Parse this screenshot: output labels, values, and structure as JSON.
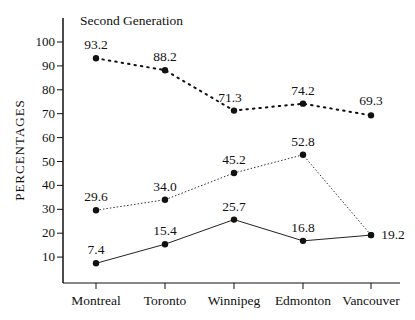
{
  "chart_data": {
    "type": "line",
    "title": "Second Generation",
    "xlabel": "",
    "ylabel": "PERCENTAGES",
    "categories": [
      "Montreal",
      "Toronto",
      "Winnipeg",
      "Edmonton",
      "Vancouver"
    ],
    "yticks": [
      10,
      20,
      30,
      40,
      50,
      60,
      70,
      80,
      90,
      100
    ],
    "ylim": [
      0,
      105
    ],
    "grid": false,
    "legend": "none",
    "series": [
      {
        "name": "upper (dotted)",
        "style": "dotted",
        "values": [
          93.2,
          88.2,
          71.3,
          74.2,
          69.3
        ],
        "labels": [
          "93.2",
          "88.2",
          "71.3",
          "74.2",
          "69.3"
        ]
      },
      {
        "name": "middle (fine dotted)",
        "style": "fine-dotted",
        "values": [
          29.6,
          34.0,
          45.2,
          52.8,
          19.2
        ],
        "labels": [
          "29.6",
          "34.0",
          "45.2",
          "52.8",
          ""
        ]
      },
      {
        "name": "lower (solid)",
        "style": "solid",
        "values": [
          7.4,
          15.4,
          25.7,
          16.8,
          19.2
        ],
        "labels": [
          "7.4",
          "15.4",
          "25.7",
          "16.8",
          "19.2"
        ]
      }
    ]
  }
}
